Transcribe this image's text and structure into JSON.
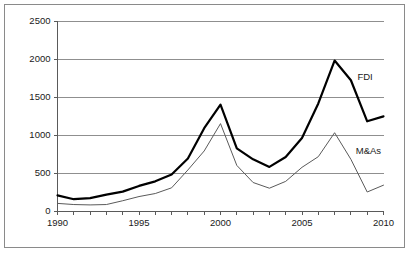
{
  "chart_data": {
    "type": "line",
    "title": "",
    "xlabel": "",
    "ylabel": "",
    "xlim": [
      1990,
      2010
    ],
    "ylim": [
      0,
      2500
    ],
    "grid": true,
    "legend_position": "inline-annotation",
    "x": [
      1990,
      1991,
      1992,
      1993,
      1994,
      1995,
      1996,
      1997,
      1998,
      1999,
      2000,
      2001,
      2002,
      2003,
      2004,
      2005,
      2006,
      2007,
      2008,
      2009,
      2010
    ],
    "y_ticks": [
      0,
      500,
      1000,
      1500,
      2000,
      2500
    ],
    "y_tick_labels": [
      "0",
      "500",
      "1000",
      "1500",
      "2000",
      "2500"
    ],
    "x_ticks": [
      1990,
      1991,
      1992,
      1993,
      1994,
      1995,
      1996,
      1997,
      1998,
      1999,
      2000,
      2001,
      2002,
      2003,
      2004,
      2005,
      2006,
      2007,
      2008,
      2009,
      2010
    ],
    "x_tick_labels_shown": [
      "1990",
      "1995",
      "2000",
      "2005",
      "2010"
    ],
    "x_tick_labels_shown_at": [
      1990,
      1995,
      2000,
      2005,
      2010
    ],
    "series": [
      {
        "name": "FDI",
        "style": "thick-black",
        "color": "#000000",
        "width": 2.2,
        "label": "FDI",
        "label_at_x": 2008.4,
        "label_at_y": 1760,
        "values": [
          205,
          155,
          170,
          215,
          255,
          330,
          390,
          480,
          690,
          1090,
          1400,
          825,
          680,
          580,
          710,
          960,
          1415,
          1980,
          1720,
          1180,
          1245
        ]
      },
      {
        "name": "M&As",
        "style": "thin-gray",
        "color": "#5a5a5a",
        "width": 1.0,
        "label": "M&As",
        "label_at_x": 2008.3,
        "label_at_y": 790,
        "values": [
          100,
          85,
          80,
          85,
          135,
          190,
          230,
          305,
          540,
          790,
          1150,
          600,
          375,
          300,
          390,
          575,
          715,
          1030,
          680,
          250,
          340
        ]
      }
    ]
  }
}
